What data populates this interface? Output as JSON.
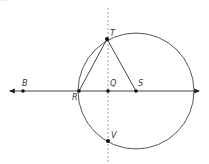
{
  "clipped_header_text": "…",
  "diagram": {
    "points": {
      "B": {
        "label": "B"
      },
      "R": {
        "label": "R"
      },
      "Q": {
        "label": "Q"
      },
      "S": {
        "label": "S"
      },
      "T": {
        "label": "T"
      },
      "V": {
        "label": "V"
      }
    },
    "colors": {
      "line": "#444444",
      "dashed": "#888888",
      "point": "#111111"
    }
  }
}
